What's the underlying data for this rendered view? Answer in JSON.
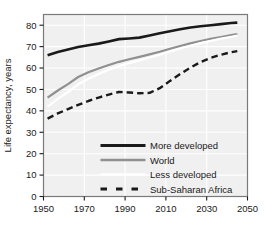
{
  "chart_data": {
    "type": "line",
    "title": "",
    "xlabel": "",
    "ylabel": "Life expectancy, years",
    "xlim": [
      1950,
      2050
    ],
    "ylim": [
      0,
      85
    ],
    "xticks": [
      1950,
      1970,
      1990,
      2010,
      2030,
      2050
    ],
    "yticks": [
      0,
      10,
      20,
      30,
      40,
      50,
      60,
      70,
      80
    ],
    "grid": true,
    "grid_color": "#ffffff",
    "plot_background": "#f0f0f0",
    "legend_position": "lower-center",
    "series": [
      {
        "name": "More developed",
        "color": "#1a1a1a",
        "style": "solid",
        "width": 2.6,
        "x": [
          1952,
          1957,
          1962,
          1967,
          1972,
          1977,
          1982,
          1987,
          1992,
          1997,
          2002,
          2007,
          2012,
          2017,
          2022,
          2027,
          2032,
          2037,
          2042,
          2045
        ],
        "y": [
          66.0,
          67.5,
          68.7,
          69.8,
          70.6,
          71.4,
          72.4,
          73.5,
          73.8,
          74.2,
          75.2,
          76.2,
          77.2,
          78.1,
          78.9,
          79.5,
          80.0,
          80.5,
          81.0,
          81.2
        ]
      },
      {
        "name": "World",
        "color": "#909090",
        "style": "solid",
        "width": 2.2,
        "x": [
          1952,
          1957,
          1962,
          1967,
          1972,
          1977,
          1982,
          1987,
          1992,
          1997,
          2002,
          2007,
          2012,
          2017,
          2022,
          2027,
          2032,
          2037,
          2042,
          2045
        ],
        "y": [
          46.2,
          49.5,
          52.5,
          55.8,
          58.0,
          59.8,
          61.4,
          62.9,
          64.1,
          65.2,
          66.4,
          67.6,
          69.0,
          70.3,
          71.5,
          72.6,
          73.6,
          74.5,
          75.4,
          75.9
        ]
      },
      {
        "name": "Less developed",
        "color": "#ffffff",
        "style": "solid",
        "width": 2.2,
        "x": [
          1952,
          1957,
          1962,
          1967,
          1972,
          1977,
          1982,
          1987,
          1992,
          1997,
          2002,
          2007,
          2012,
          2017,
          2022,
          2027,
          2032,
          2037,
          2042,
          2045
        ],
        "y": [
          42.0,
          45.6,
          48.8,
          52.4,
          55.0,
          57.2,
          59.2,
          60.9,
          62.3,
          63.6,
          64.9,
          66.2,
          67.7,
          69.1,
          70.4,
          71.6,
          72.7,
          73.7,
          74.6,
          75.1
        ]
      },
      {
        "name": "Sub-Saharan Africa",
        "color": "#1a1a1a",
        "style": "dashed",
        "width": 2.4,
        "x": [
          1952,
          1957,
          1962,
          1967,
          1972,
          1977,
          1982,
          1987,
          1992,
          1997,
          2002,
          2007,
          2012,
          2017,
          2022,
          2027,
          2032,
          2037,
          2042,
          2045
        ],
        "y": [
          36.4,
          38.8,
          40.8,
          42.8,
          44.6,
          46.2,
          47.6,
          48.8,
          48.6,
          48.2,
          48.4,
          50.6,
          54.0,
          57.2,
          60.2,
          62.8,
          64.8,
          66.2,
          67.4,
          67.9
        ]
      }
    ],
    "legend": [
      {
        "label": "More developed",
        "color": "#1a1a1a",
        "style": "solid",
        "width": 3.2
      },
      {
        "label": "World",
        "color": "#909090",
        "style": "solid",
        "width": 2.4
      },
      {
        "label": "Less developed",
        "color": "#ffffff",
        "style": "solid",
        "width": 2.4
      },
      {
        "label": "Sub-Saharan Africa",
        "color": "#1a1a1a",
        "style": "dashed",
        "width": 3.0
      }
    ]
  }
}
